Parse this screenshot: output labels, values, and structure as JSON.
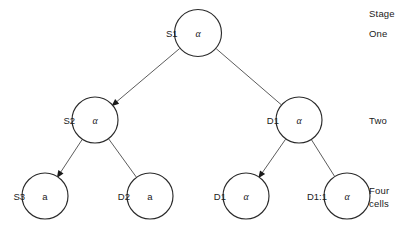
{
  "diagram": {
    "type": "cell-lineage-tree",
    "nodes": [
      {
        "id": "S1",
        "label": "S1",
        "symbol": "α",
        "symbol_kind": "alpha",
        "cx": 198,
        "cy": 33,
        "r": 23.5,
        "level": 1
      },
      {
        "id": "S2",
        "label": "S2",
        "symbol": "α",
        "symbol_kind": "alpha",
        "cx": 95,
        "cy": 120,
        "r": 23.0,
        "level": 2
      },
      {
        "id": "D1",
        "label": "D1",
        "symbol": "α",
        "symbol_kind": "alpha",
        "cx": 299,
        "cy": 120,
        "r": 23.0,
        "level": 2
      },
      {
        "id": "S3",
        "label": "S3",
        "symbol": "a",
        "symbol_kind": "plain",
        "cx": 45,
        "cy": 196,
        "r": 23.0,
        "level": 3
      },
      {
        "id": "D2",
        "label": "D2",
        "symbol": "a",
        "symbol_kind": "plain",
        "cx": 150,
        "cy": 196,
        "r": 23.0,
        "level": 3
      },
      {
        "id": "D1b",
        "label": "D1",
        "symbol": "α",
        "symbol_kind": "alpha",
        "cx": 246,
        "cy": 196,
        "r": 23.0,
        "level": 3
      },
      {
        "id": "D1:1",
        "label": "D1:1",
        "symbol": "α",
        "symbol_kind": "alpha",
        "cx": 347,
        "cy": 196,
        "r": 23.0,
        "level": 3
      }
    ],
    "edges": [
      {
        "from": "S1",
        "to": "S2",
        "arrow": true
      },
      {
        "from": "S1",
        "to": "D1",
        "arrow": false
      },
      {
        "from": "S2",
        "to": "S3",
        "arrow": true
      },
      {
        "from": "S2",
        "to": "D2",
        "arrow": false
      },
      {
        "from": "D1",
        "to": "D1b",
        "arrow": true
      },
      {
        "from": "D1",
        "to": "D1:1",
        "arrow": false
      }
    ]
  },
  "stage_column": {
    "header": "Stage",
    "entries": [
      {
        "text": "One",
        "x": 369,
        "y": 33
      },
      {
        "text": "Two",
        "x": 369,
        "y": 120
      },
      {
        "text": "Four",
        "x": 369,
        "y": 190
      },
      {
        "text": "cells",
        "x": 369,
        "y": 203
      }
    ],
    "header_x": 369,
    "header_y": 13
  },
  "colors": {
    "node_stroke": "#2b2b2b",
    "edge_stroke": "#4a4a4a",
    "text": "#1a1a1a",
    "background": "#ffffff"
  }
}
